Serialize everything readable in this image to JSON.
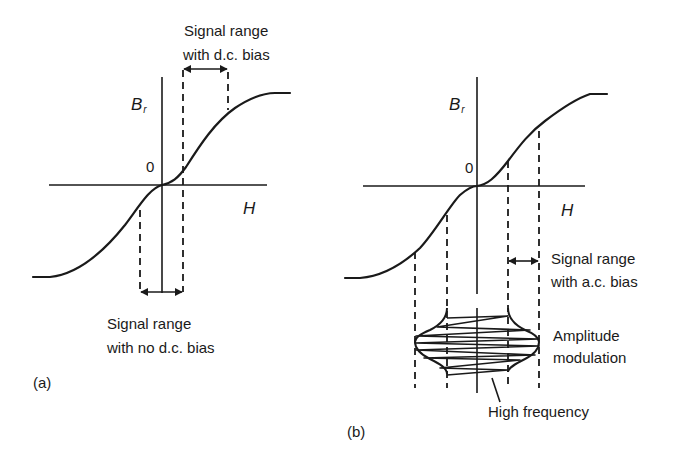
{
  "figure": {
    "colors": {
      "ink": "#1a1a1a",
      "background": "#ffffff"
    }
  },
  "panel_a": {
    "label": "(a)",
    "axes": {
      "y_label": "B",
      "y_label_sub": "r",
      "x_label": "H",
      "origin_label": "0"
    },
    "annotations": {
      "dc_bias": {
        "line1": "Signal range",
        "line2": "with d.c. bias"
      },
      "no_dc_bias": {
        "line1": "Signal range",
        "line2": "with no d.c. bias"
      }
    }
  },
  "panel_b": {
    "label": "(b)",
    "axes": {
      "y_label": "B",
      "y_label_sub": "r",
      "x_label": "H",
      "origin_label": "0"
    },
    "annotations": {
      "ac_bias": {
        "line1": "Signal range",
        "line2": "with a.c. bias"
      },
      "amplitude_modulation": {
        "line1": "Amplitude",
        "line2": "modulation"
      },
      "high_frequency": "High frequency"
    }
  }
}
